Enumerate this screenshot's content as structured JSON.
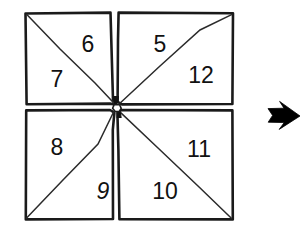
{
  "figure": {
    "style": "hand-drawn line art, black ink on white",
    "background_color": "#ffffff",
    "ink_color": "#111111",
    "outline_color": "#1a1a1a",
    "diagonal_color": "#2b2b2b",
    "arrow_color": "#000000"
  },
  "quadrants": [
    {
      "name": "top-left",
      "diagonal": "top-left-to-bottom-right",
      "labels": [
        {
          "id": "label-6",
          "text": "6",
          "position": "upper-right",
          "x": 88,
          "y": 44
        },
        {
          "id": "label-7",
          "text": "7",
          "position": "lower-left",
          "x": 57,
          "y": 79
        }
      ]
    },
    {
      "name": "top-right",
      "diagonal": "bottom-left-to-top-right",
      "labels": [
        {
          "id": "label-5",
          "text": "5",
          "position": "upper-left",
          "x": 160,
          "y": 44
        },
        {
          "id": "label-12",
          "text": "12",
          "position": "lower-right",
          "x": 201,
          "y": 75
        }
      ]
    },
    {
      "name": "bottom-left",
      "diagonal": "bottom-left-to-top-right",
      "labels": [
        {
          "id": "label-8",
          "text": "8",
          "position": "upper-left",
          "x": 57,
          "y": 147
        },
        {
          "id": "label-9",
          "text": "9",
          "position": "lower-right",
          "x": 103,
          "y": 191
        }
      ]
    },
    {
      "name": "bottom-right",
      "diagonal": "top-left-to-bottom-right",
      "labels": [
        {
          "id": "label-11",
          "text": "11",
          "position": "upper-right",
          "x": 199,
          "y": 149
        },
        {
          "id": "label-10",
          "text": "10",
          "position": "lower-left",
          "x": 165,
          "y": 191
        }
      ]
    }
  ],
  "all_numbers": [
    "5",
    "6",
    "7",
    "8",
    "9",
    "10",
    "11",
    "12"
  ],
  "arrow": {
    "id": "transform-arrow",
    "direction": "right",
    "x": 268,
    "y": 115,
    "width": 32,
    "height": 26,
    "color": "#000000"
  }
}
